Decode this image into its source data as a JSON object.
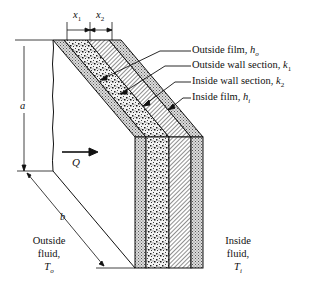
{
  "diagram": {
    "type": "composite wall heat transfer",
    "dimensions": {
      "x1": "x",
      "x1_sub": "1",
      "x2": "x",
      "x2_sub": "2",
      "height": "a",
      "width": "b"
    },
    "heat_flow": {
      "label": "Q"
    },
    "layers": [
      {
        "name": "Outside film",
        "symbol": "h",
        "sub": "o"
      },
      {
        "name": "Outside wall section",
        "symbol": "k",
        "sub": "1"
      },
      {
        "name": "Inside wall section",
        "symbol": "k",
        "sub": "2"
      },
      {
        "name": "Inside film",
        "symbol": "h",
        "sub": "i"
      }
    ],
    "outside": {
      "line1": "Outside",
      "line2": "fluid,",
      "symbol": "T",
      "sub": "o"
    },
    "inside": {
      "line1": "Inside",
      "line2": "fluid,",
      "symbol": "T",
      "sub": "i"
    }
  }
}
